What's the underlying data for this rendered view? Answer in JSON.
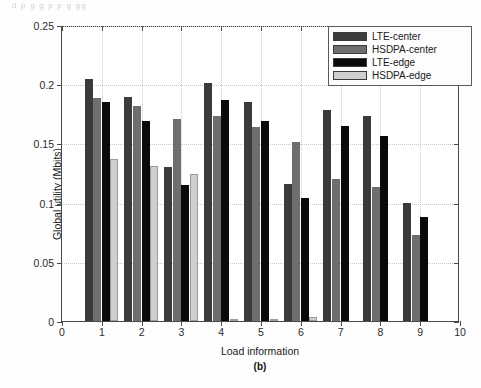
{
  "figure": {
    "top_remnant": "d p   g        g p    p   g     gg",
    "caption": "(b)"
  },
  "legend": {
    "position": "top-right",
    "entries": [
      {
        "label": "LTE-center",
        "color": "#3b3b3b"
      },
      {
        "label": "HSDPA-center",
        "color": "#6e6e6e"
      },
      {
        "label": "LTE-edge",
        "color": "#0a0a0a"
      },
      {
        "label": "HSDPA-edge",
        "color": "#cfcfcf"
      }
    ]
  },
  "chart_data": {
    "type": "bar",
    "title": "",
    "subtitle": "(b)",
    "xlabel": "Load information",
    "ylabel": "Global utility (Mbits)",
    "categories": [
      "1",
      "2",
      "3",
      "4",
      "5",
      "6",
      "7",
      "8",
      "9"
    ],
    "x": [
      1,
      2,
      3,
      4,
      5,
      6,
      7,
      8,
      9
    ],
    "xlim": [
      0,
      10
    ],
    "ylim": [
      0,
      0.25
    ],
    "xticks": [
      "0",
      "1",
      "2",
      "3",
      "4",
      "5",
      "6",
      "7",
      "8",
      "9",
      "10"
    ],
    "yticks": [
      "0",
      "0.05",
      "0.1",
      "0.15",
      "0.2",
      "0.25"
    ],
    "grid": true,
    "legend_position": "top-right",
    "series": [
      {
        "name": "LTE-center",
        "color": "#3b3b3b",
        "values": [
          0.204,
          0.189,
          0.13,
          0.201,
          0.185,
          0.116,
          0.178,
          0.173,
          0.1
        ]
      },
      {
        "name": "HSDPA-center",
        "color": "#6e6e6e",
        "values": [
          0.188,
          0.182,
          0.171,
          0.173,
          0.164,
          0.151,
          0.12,
          0.113,
          0.073
        ]
      },
      {
        "name": "LTE-edge",
        "color": "#0a0a0a",
        "values": [
          0.185,
          0.169,
          0.115,
          0.187,
          0.169,
          0.104,
          0.165,
          0.156,
          0.088
        ]
      },
      {
        "name": "HSDPA-edge",
        "color": "#cfcfcf",
        "values": [
          0.137,
          0.131,
          0.124,
          0.001,
          0.0015,
          0.003,
          0.0,
          0.0,
          0.0
        ]
      }
    ]
  }
}
